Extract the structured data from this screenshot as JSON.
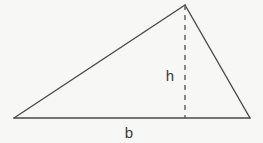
{
  "figure": {
    "kind": "geometry-diagram",
    "shape": "triangle",
    "canvas": {
      "width": 263,
      "height": 143
    },
    "background_color": "#f7f7f5",
    "stroke_color": "#4a4a4a",
    "label_color": "#3a3a3a",
    "stroke_width": 1.4,
    "labels": {
      "height": "h",
      "base": "b"
    },
    "label_positions": {
      "height": {
        "x": 170,
        "y": 81
      },
      "base": {
        "x": 126,
        "y": 138
      }
    },
    "vertices": {
      "left": {
        "x": 14,
        "y": 118
      },
      "apex": {
        "x": 185,
        "y": 5
      },
      "right": {
        "x": 250,
        "y": 118
      }
    },
    "altitude": {
      "from": {
        "x": 185,
        "y": 5
      },
      "to": {
        "x": 185,
        "y": 118
      },
      "style": "dashed",
      "dash_pattern": "5,5"
    },
    "edges": [
      {
        "name": "left-edge",
        "from": "left",
        "to": "apex"
      },
      {
        "name": "right-edge",
        "from": "apex",
        "to": "right"
      },
      {
        "name": "base-edge",
        "from": "left",
        "to": "right"
      }
    ]
  }
}
